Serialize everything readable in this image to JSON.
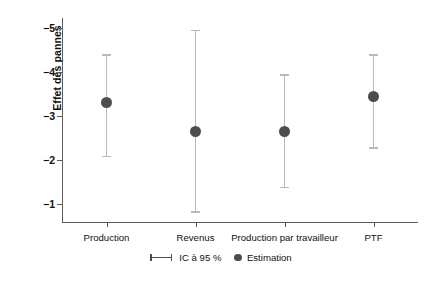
{
  "chart_data": {
    "type": "scatter",
    "title": "",
    "xlabel": "",
    "ylabel": "Effet des pannes",
    "categories": [
      "Production",
      "Revenus",
      "Production par travailleur",
      "PTF"
    ],
    "yticks": [
      -5,
      -4,
      -3,
      -2,
      -1
    ],
    "ytick_labels": [
      "−5",
      "−4",
      "−3",
      "−2",
      "−1"
    ],
    "ylim": [
      -5.4,
      -0.6
    ],
    "y_axis_inverted": true,
    "grid": false,
    "legend_position": "bottom-center",
    "series": [
      {
        "name": "Estimation",
        "values": [
          -3.3,
          -2.65,
          -2.65,
          -3.45
        ]
      },
      {
        "name": "IC à 95 %",
        "ci_low": [
          -4.4,
          -4.95,
          -3.95,
          -4.4
        ],
        "ci_high": [
          -2.1,
          -0.85,
          -1.4,
          -2.3
        ]
      }
    ],
    "points": [
      {
        "category": "Production",
        "estimate": -3.3,
        "ci_low": -4.4,
        "ci_high": -2.1
      },
      {
        "category": "Revenus",
        "estimate": -2.65,
        "ci_low": -4.95,
        "ci_high": -0.85
      },
      {
        "category": "Production par travailleur",
        "estimate": -2.65,
        "ci_low": -3.95,
        "ci_high": -1.4
      },
      {
        "category": "PTF",
        "estimate": -3.45,
        "ci_low": -4.4,
        "ci_high": -2.3
      }
    ],
    "colors": {
      "point": "#4d4d4d",
      "whisker": "#b9b9b9",
      "axis": "#5a5a5a",
      "text": "#111111",
      "background": "#ffffff"
    }
  },
  "legend": {
    "ci_label": "IC à 95 %",
    "estimate_label": "Estimation"
  }
}
